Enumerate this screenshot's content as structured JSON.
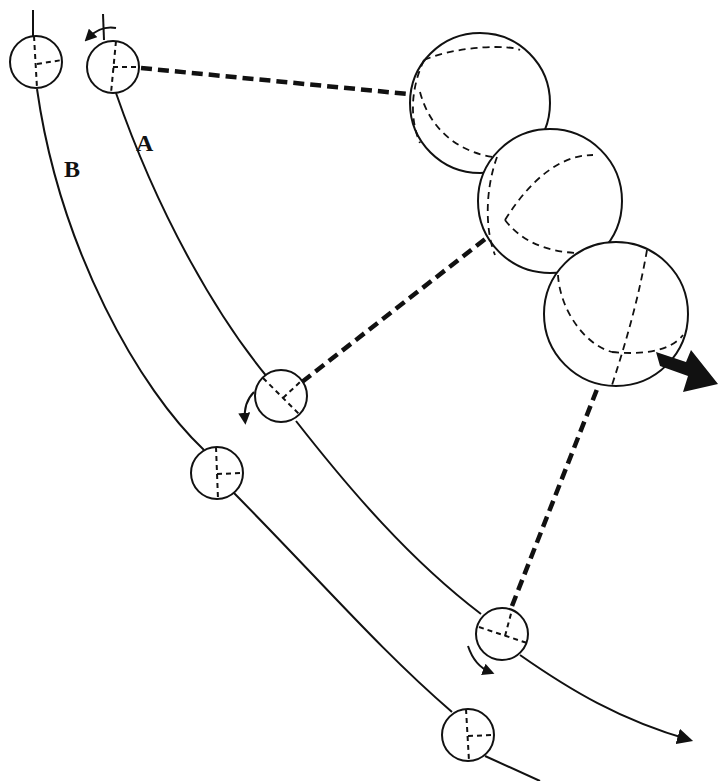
{
  "diagram": {
    "type": "motion-diagram",
    "labels": {
      "path_a": "A",
      "path_b": "B"
    },
    "paths": [
      {
        "id": "A",
        "description": "curved trajectory with ball rotating, ends in arrow"
      },
      {
        "id": "B",
        "description": "parallel curved trajectory, ball without rotation"
      }
    ],
    "balls_on_path_a": 3,
    "balls_on_path_b": 3,
    "spheres": 3,
    "colors": {
      "stroke": "#111111",
      "background": "#ffffff"
    }
  }
}
